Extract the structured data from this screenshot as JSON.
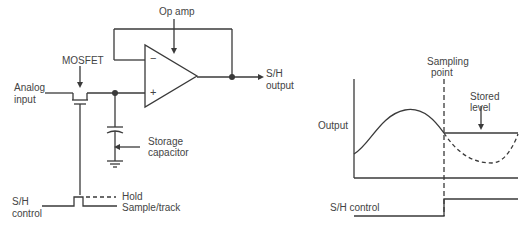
{
  "circuit": {
    "op_amp_label": "Op amp",
    "mosfet_label": "MOSFET",
    "analog_input_label": [
      "Analog",
      "input"
    ],
    "sh_output_label": [
      "S/H",
      "output"
    ],
    "storage_capacitor_label": [
      "Storage",
      "capacitor"
    ],
    "sh_control_label": [
      "S/H",
      "control"
    ],
    "hold_label": "Hold",
    "sample_track_label": "Sample/track",
    "minus_sign": "−",
    "plus_sign": "+"
  },
  "waveform": {
    "output_label": "Output",
    "sampling_point_label": [
      "Sampling",
      "point"
    ],
    "stored_level_label": [
      "Stored",
      "level"
    ],
    "sh_control_label": "S/H control"
  },
  "colors": {
    "line": "#3a3a3a",
    "text": "#444444",
    "background": "#ffffff"
  }
}
